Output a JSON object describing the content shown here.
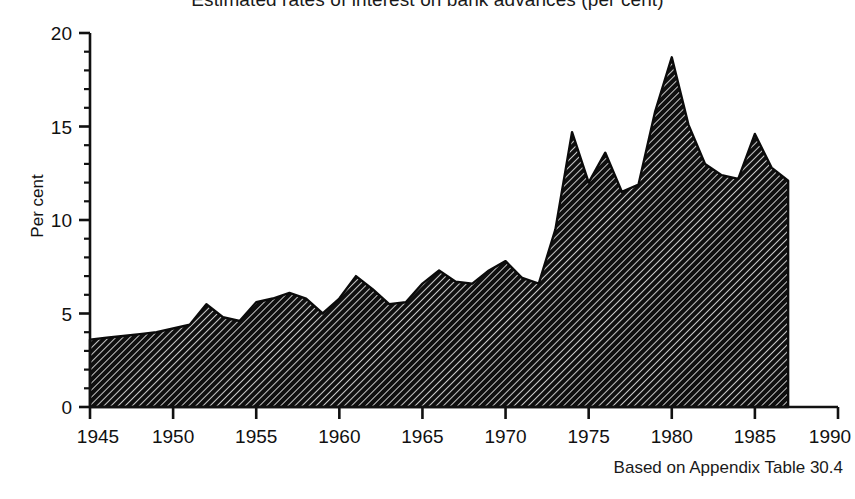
{
  "chart_title": "Estimated rates of interest on bank advances (per cent)",
  "source_note": "Based on Appendix Table 30.4",
  "axes": {
    "ylabel": "Per cent",
    "xlabel": "",
    "ytick_labels": [
      "0",
      "5",
      "10",
      "15",
      "20"
    ],
    "xtick_labels": [
      "1945",
      "1950",
      "1955",
      "1960",
      "1965",
      "1970",
      "1975",
      "1980",
      "1985",
      "1990"
    ]
  },
  "style": {
    "axis_color": "#111111",
    "fill_color": "#1c1c1c",
    "hatch_color": "#111111",
    "background": "#ffffff",
    "hatch_pattern": "diagonal-45",
    "grid": false,
    "legend": false
  },
  "chart_data": {
    "type": "area",
    "title": "Estimated rates of interest on bank advances (per cent)",
    "xlabel": "",
    "ylabel": "Per cent",
    "xlim": [
      1945,
      1990
    ],
    "ylim": [
      0,
      20
    ],
    "xticks": [
      1945,
      1950,
      1955,
      1960,
      1965,
      1970,
      1975,
      1980,
      1985,
      1990
    ],
    "yticks": [
      0,
      5,
      10,
      15,
      20
    ],
    "minor_ytick_step": 1,
    "minor_xtick_step": 1,
    "grid": false,
    "legend_position": "none",
    "series": [
      {
        "name": "Estimated rate of interest on bank advances",
        "x": [
          1945,
          1946,
          1947,
          1948,
          1949,
          1950,
          1951,
          1952,
          1953,
          1954,
          1955,
          1956,
          1957,
          1958,
          1959,
          1960,
          1961,
          1962,
          1963,
          1964,
          1965,
          1966,
          1967,
          1968,
          1969,
          1970,
          1971,
          1972,
          1973,
          1974,
          1975,
          1976,
          1977,
          1978,
          1979,
          1980,
          1981,
          1982,
          1983,
          1984,
          1985,
          1986,
          1987
        ],
        "values": [
          3.6,
          3.7,
          3.8,
          3.9,
          4.0,
          4.2,
          4.4,
          5.5,
          4.8,
          4.6,
          5.6,
          5.8,
          6.1,
          5.8,
          5.0,
          5.8,
          7.0,
          6.3,
          5.5,
          5.6,
          6.6,
          7.3,
          6.7,
          6.6,
          7.3,
          7.8,
          6.9,
          6.6,
          9.5,
          14.7,
          12.0,
          13.6,
          11.5,
          11.9,
          15.8,
          18.7,
          15.1,
          13.0,
          12.4,
          12.2,
          14.6,
          12.8,
          12.1
        ]
      }
    ]
  }
}
